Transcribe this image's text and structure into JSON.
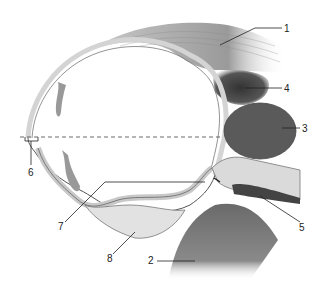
{
  "diagram": {
    "type": "anatomical cross-section (sagittal, cervix/uterus)",
    "labels": [
      {
        "id": "1",
        "text": "1",
        "x": 284,
        "y": 30
      },
      {
        "id": "2",
        "text": "2",
        "x": 150,
        "y": 264
      },
      {
        "id": "3",
        "text": "3",
        "x": 303,
        "y": 131
      },
      {
        "id": "4",
        "text": "4",
        "x": 285,
        "y": 91
      },
      {
        "id": "5",
        "text": "5",
        "x": 301,
        "y": 227
      },
      {
        "id": "6",
        "text": "6",
        "x": 31,
        "y": 174
      },
      {
        "id": "7",
        "text": "7",
        "x": 61,
        "y": 226
      },
      {
        "id": "8",
        "text": "8",
        "x": 110,
        "y": 260
      }
    ],
    "colors": {
      "tissue_light": "#d6d6d6",
      "tissue_mid": "#b8b8b8",
      "tissue_dark": "#555555",
      "muscle": "#a0a0a0",
      "outline": "#555555"
    }
  }
}
